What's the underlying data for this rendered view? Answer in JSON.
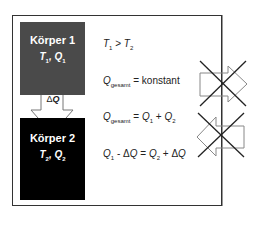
{
  "diagram": {
    "body1": {
      "title": "Körper 1",
      "T": "T",
      "T_sub": "1",
      "Q": "Q",
      "Q_sub": "1",
      "color": "#4a4a4a"
    },
    "body2": {
      "title": "Körper 2",
      "T": "T",
      "T_sub": "2",
      "Q": "Q",
      "Q_sub": "2",
      "color": "#000000"
    },
    "transfer_arrow": {
      "delta": "Δ",
      "label": "Q"
    },
    "equations": {
      "eq1": {
        "lhs": "T",
        "lhs_sub": "1",
        "op": " > ",
        "rhs": "T",
        "rhs_sub": "2"
      },
      "eq2": {
        "lhs": "Q",
        "lhs_sub": "gesamt",
        "rest": " = konstant"
      },
      "eq3": {
        "lhs": "Q",
        "lhs_sub": "gesamt",
        "op": " = ",
        "a": "Q",
        "a_sub": "1",
        "plus": " + ",
        "b": "Q",
        "b_sub": "2"
      },
      "eq4": {
        "a": "Q",
        "a_sub": "1",
        "minus": " - Δ",
        "dq": "Q",
        "eq": " = ",
        "b": "Q",
        "b_sub": "2",
        "plus": " + Δ",
        "dq2": "Q"
      }
    },
    "crossed_arrows": [
      {
        "direction": "right",
        "crossed": true
      },
      {
        "direction": "left",
        "crossed": true
      }
    ]
  }
}
